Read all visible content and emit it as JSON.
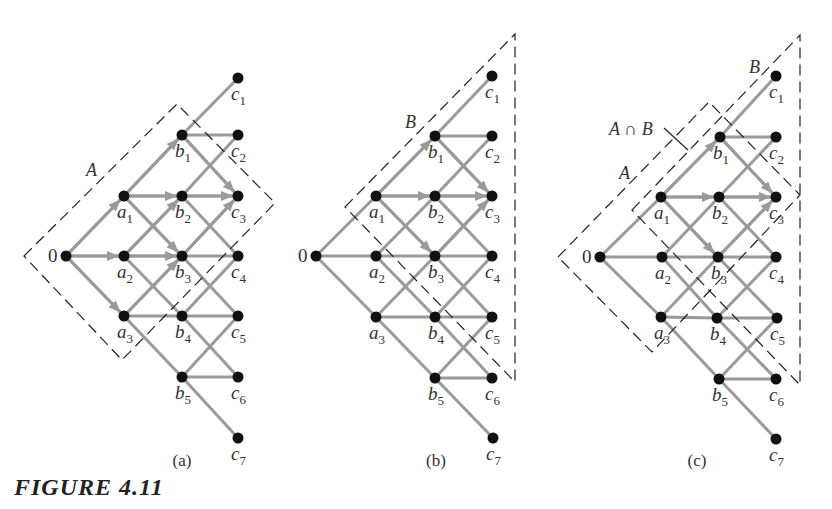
{
  "figure": {
    "title": "FIGURE 4.11",
    "colors": {
      "edge": "#9a9a9a",
      "node": "#111111",
      "region": "#222222",
      "text": "#333333"
    }
  },
  "panels": [
    {
      "id": "a",
      "caption": "(a)",
      "caption_pos": [
        182,
        466
      ],
      "nodes": {
        "0": {
          "x": 66,
          "y": 256,
          "label": "0"
        },
        "a1": {
          "x": 124,
          "y": 196,
          "label": "a",
          "sub": "1"
        },
        "a2": {
          "x": 124,
          "y": 256,
          "label": "a",
          "sub": "2"
        },
        "a3": {
          "x": 124,
          "y": 316,
          "label": "a",
          "sub": "3"
        },
        "b1": {
          "x": 182,
          "y": 135,
          "label": "b",
          "sub": "1"
        },
        "b2": {
          "x": 182,
          "y": 196,
          "label": "b",
          "sub": "2"
        },
        "b3": {
          "x": 182,
          "y": 256,
          "label": "b",
          "sub": "3"
        },
        "b4": {
          "x": 182,
          "y": 316,
          "label": "b",
          "sub": "4"
        },
        "b5": {
          "x": 182,
          "y": 377,
          "label": "b",
          "sub": "5"
        },
        "c1": {
          "x": 238,
          "y": 78,
          "label": "c",
          "sub": "1"
        },
        "c2": {
          "x": 238,
          "y": 135,
          "label": "c",
          "sub": "2"
        },
        "c3": {
          "x": 238,
          "y": 196,
          "label": "c",
          "sub": "3"
        },
        "c4": {
          "x": 238,
          "y": 256,
          "label": "c",
          "sub": "4"
        },
        "c5": {
          "x": 238,
          "y": 316,
          "label": "c",
          "sub": "5"
        },
        "c6": {
          "x": 238,
          "y": 377,
          "label": "c",
          "sub": "6"
        },
        "c7": {
          "x": 238,
          "y": 438,
          "label": "c",
          "sub": "7"
        }
      },
      "arrows": [
        [
          "0",
          "a1"
        ],
        [
          "0",
          "a2"
        ],
        [
          "0",
          "a3"
        ],
        [
          "a1",
          "b1"
        ],
        [
          "a1",
          "b2"
        ],
        [
          "a1",
          "b3"
        ],
        [
          "a2",
          "b2"
        ],
        [
          "a2",
          "b3"
        ],
        [
          "a3",
          "b3"
        ],
        [
          "b1",
          "c3"
        ],
        [
          "b2",
          "c3"
        ],
        [
          "b3",
          "c3"
        ]
      ],
      "regions": [
        {
          "name": "A",
          "points": [
            [
              24,
              256
            ],
            [
              177,
              104
            ],
            [
              275,
              203
            ],
            [
              122,
              360
            ]
          ],
          "label": "A",
          "label_pos": [
            86,
            176
          ]
        }
      ]
    },
    {
      "id": "b",
      "caption": "(b)",
      "caption_pos": [
        436,
        466
      ],
      "nodes": {
        "0": {
          "x": 316,
          "y": 256,
          "label": "0"
        },
        "a1": {
          "x": 376,
          "y": 196,
          "label": "a",
          "sub": "1"
        },
        "a2": {
          "x": 376,
          "y": 256,
          "label": "a",
          "sub": "2"
        },
        "a3": {
          "x": 376,
          "y": 317,
          "label": "a",
          "sub": "3"
        },
        "b1": {
          "x": 435,
          "y": 136,
          "label": "b",
          "sub": "1"
        },
        "b2": {
          "x": 435,
          "y": 196,
          "label": "b",
          "sub": "2"
        },
        "b3": {
          "x": 435,
          "y": 256,
          "label": "b",
          "sub": "3"
        },
        "b4": {
          "x": 435,
          "y": 317,
          "label": "b",
          "sub": "4"
        },
        "b5": {
          "x": 435,
          "y": 378,
          "label": "b",
          "sub": "5"
        },
        "c1": {
          "x": 492,
          "y": 76,
          "label": "c",
          "sub": "1"
        },
        "c2": {
          "x": 492,
          "y": 136,
          "label": "c",
          "sub": "2"
        },
        "c3": {
          "x": 492,
          "y": 196,
          "label": "c",
          "sub": "3"
        },
        "c4": {
          "x": 492,
          "y": 256,
          "label": "c",
          "sub": "4"
        },
        "c5": {
          "x": 492,
          "y": 317,
          "label": "c",
          "sub": "5"
        },
        "c6": {
          "x": 492,
          "y": 378,
          "label": "c",
          "sub": "6"
        },
        "c7": {
          "x": 493,
          "y": 438,
          "label": "c",
          "sub": "7"
        }
      },
      "arrows": [
        [
          "a1",
          "b1"
        ],
        [
          "a1",
          "b2"
        ],
        [
          "a1",
          "b3"
        ],
        [
          "b1",
          "c3"
        ],
        [
          "b2",
          "c3"
        ],
        [
          "b3",
          "c3"
        ]
      ],
      "regions": [
        {
          "name": "B",
          "points": [
            [
              345,
              207
            ],
            [
              515,
              34
            ],
            [
              515,
              382
            ]
          ],
          "label": "B",
          "label_pos": [
            405,
            128
          ]
        }
      ]
    },
    {
      "id": "c",
      "caption": "(c)",
      "caption_pos": [
        697,
        466
      ],
      "nodes": {
        "0": {
          "x": 600,
          "y": 257,
          "label": "0"
        },
        "a1": {
          "x": 661,
          "y": 197,
          "label": "a",
          "sub": "1"
        },
        "a2": {
          "x": 662,
          "y": 257,
          "label": "a",
          "sub": "2"
        },
        "a3": {
          "x": 661,
          "y": 317,
          "label": "a",
          "sub": "3"
        },
        "b1": {
          "x": 720,
          "y": 137,
          "label": "b",
          "sub": "1"
        },
        "b2": {
          "x": 719,
          "y": 197,
          "label": "b",
          "sub": "2"
        },
        "b3": {
          "x": 718,
          "y": 257,
          "label": "b",
          "sub": "3"
        },
        "b4": {
          "x": 717,
          "y": 318,
          "label": "b",
          "sub": "4"
        },
        "b5": {
          "x": 719,
          "y": 379,
          "label": "b",
          "sub": "5"
        },
        "c1": {
          "x": 776,
          "y": 76,
          "label": "c",
          "sub": "1"
        },
        "c2": {
          "x": 776,
          "y": 137,
          "label": "c",
          "sub": "2"
        },
        "c3": {
          "x": 776,
          "y": 197,
          "label": "c",
          "sub": "3"
        },
        "c4": {
          "x": 776,
          "y": 257,
          "label": "c",
          "sub": "4"
        },
        "c5": {
          "x": 777,
          "y": 318,
          "label": "c",
          "sub": "5"
        },
        "c6": {
          "x": 776,
          "y": 379,
          "label": "c",
          "sub": "6"
        },
        "c7": {
          "x": 776,
          "y": 439,
          "label": "c",
          "sub": "7"
        }
      },
      "arrows": [
        [
          "a1",
          "b1"
        ],
        [
          "a1",
          "b2"
        ],
        [
          "a1",
          "b3"
        ],
        [
          "b1",
          "c3"
        ],
        [
          "b2",
          "c3"
        ],
        [
          "b3",
          "c3"
        ]
      ],
      "regions": [
        {
          "name": "A",
          "points": [
            [
              558,
              257
            ],
            [
              709,
              102
            ],
            [
              800,
              195
            ],
            [
              652,
              352
            ]
          ],
          "label": "A",
          "label_pos": [
            619,
            179
          ]
        },
        {
          "name": "B",
          "points": [
            [
              632,
              210
            ],
            [
              800,
              35
            ],
            [
              800,
              385
            ]
          ],
          "label": "B",
          "label_pos": [
            749,
            73
          ]
        }
      ],
      "annotations": [
        {
          "text": "A ∩ B",
          "pos": [
            609,
            135
          ],
          "leader": [
            [
              664,
              128
            ],
            [
              688,
              150
            ]
          ]
        }
      ]
    }
  ]
}
